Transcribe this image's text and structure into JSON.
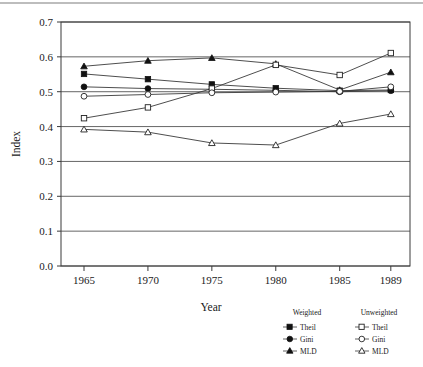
{
  "chart_data": {
    "type": "line",
    "title": "",
    "xlabel": "Year",
    "ylabel": "Index",
    "categories": [
      1965,
      1970,
      1975,
      1980,
      1985,
      1989
    ],
    "xlim": [
      1963.2,
      1990.5
    ],
    "ylim": [
      0.0,
      0.7
    ],
    "grid": true,
    "legend_position": "below-right",
    "xticks": [
      "1965",
      "1970",
      "1975",
      "1980",
      "1985",
      "1989"
    ],
    "yticks": [
      "0.0",
      "0.1",
      "0.2",
      "0.3",
      "0.4",
      "0.5",
      "0.6",
      "0.7"
    ],
    "series": [
      {
        "name": "Theil",
        "group": "Weighted",
        "marker": "filled-square",
        "values": [
          0.551,
          0.536,
          0.521,
          0.51,
          0.503,
          0.505
        ]
      },
      {
        "name": "Gini",
        "group": "Weighted",
        "marker": "filled-circle",
        "values": [
          0.514,
          0.509,
          0.507,
          0.504,
          0.5,
          0.503
        ]
      },
      {
        "name": "MLD",
        "group": "Weighted",
        "marker": "filled-triangle",
        "values": [
          0.573,
          0.589,
          0.597,
          0.58,
          0.505,
          0.556
        ]
      },
      {
        "name": "Theil",
        "group": "Unweighted",
        "marker": "open-square",
        "values": [
          0.424,
          0.455,
          0.509,
          0.577,
          0.548,
          0.611
        ]
      },
      {
        "name": "Gini",
        "group": "Unweighted",
        "marker": "open-circle",
        "values": [
          0.487,
          0.492,
          0.497,
          0.499,
          0.501,
          0.514
        ]
      },
      {
        "name": "MLD",
        "group": "Unweighted",
        "marker": "open-triangle",
        "values": [
          0.392,
          0.384,
          0.353,
          0.347,
          0.409,
          0.436
        ]
      }
    ]
  },
  "legend": {
    "weighted_header": "Weighted",
    "unweighted_header": "Unweighted",
    "rows": [
      {
        "label_left": "Theil",
        "label_right": "Theil"
      },
      {
        "label_left": "Gini",
        "label_right": "Gini"
      },
      {
        "label_left": "MLD",
        "label_right": "MLD"
      }
    ]
  },
  "axis": {
    "x_title": "Year",
    "y_title": "Index"
  },
  "ticks": {
    "y": [
      "0.7",
      "0.6",
      "0.5",
      "0.4",
      "0.3",
      "0.2",
      "0.1",
      "0.0"
    ],
    "x": [
      "1965",
      "1970",
      "1975",
      "1980",
      "1985",
      "1989"
    ]
  }
}
